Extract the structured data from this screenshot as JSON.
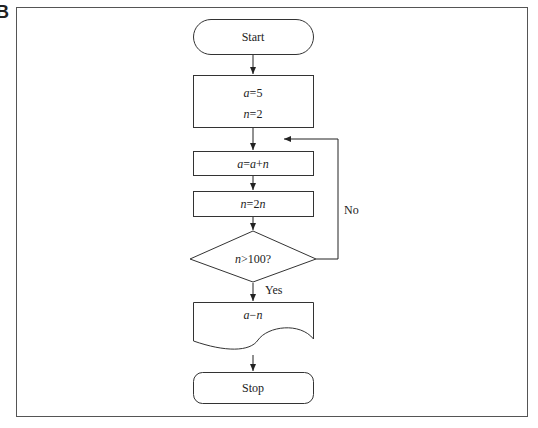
{
  "figure_label": "B",
  "nodes": {
    "start": {
      "label": "Start"
    },
    "init": {
      "line1": {
        "var": "a",
        "op": "=",
        "val": "5"
      },
      "line2": {
        "var": "n",
        "op": "=",
        "val": "2"
      }
    },
    "update_a": {
      "var": "a",
      "op": "=",
      "rhs_var1": "a",
      "rhs_op": "+",
      "rhs_var2": "n"
    },
    "update_n": {
      "var": "n",
      "op": "=",
      "rhs": "2",
      "rhs_var": "n"
    },
    "decision": {
      "var": "n",
      "op": ">",
      "val": "100?"
    },
    "output": {
      "var1": "a",
      "op": "−",
      "var2": "n"
    },
    "stop": {
      "label": "Stop"
    }
  },
  "edges": {
    "no_label": "No",
    "yes_label": "Yes"
  }
}
